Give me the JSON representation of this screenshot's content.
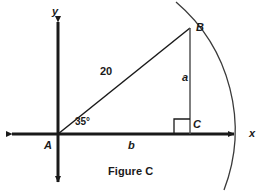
{
  "figure": {
    "caption": "Figure C",
    "axes": {
      "x_label": "x",
      "y_label": "y"
    },
    "points": {
      "origin_vertex": "A",
      "top_vertex": "B",
      "right_angle_vertex": "C"
    },
    "sides": {
      "opposite_label": "a",
      "adjacent_label": "b",
      "hypotenuse_value": "20"
    },
    "angle": {
      "at_vertex": "A",
      "measure_label": "35°",
      "degrees": 35
    },
    "annotations": {
      "right_angle_marker": "right-angle-square",
      "arc": "circular-arc-centered-at-A-through-B"
    },
    "colors": {
      "stroke": "#1a1a1a",
      "background": "#ffffff",
      "arc_stroke": "#3a3a3a"
    }
  },
  "geometry": {
    "origin": {
      "x": 58,
      "y": 134
    },
    "B": {
      "x": 190,
      "y": 28
    },
    "C": {
      "x": 190,
      "y": 134
    },
    "x_axis": {
      "x1": 8,
      "x2": 238,
      "y": 134
    },
    "y_axis": {
      "x": 58,
      "y1": 18,
      "y2": 186
    },
    "arc": {
      "start": {
        "x": 176,
        "y": 2
      },
      "end": {
        "x": 224,
        "y": 190
      },
      "radius": 168
    }
  }
}
